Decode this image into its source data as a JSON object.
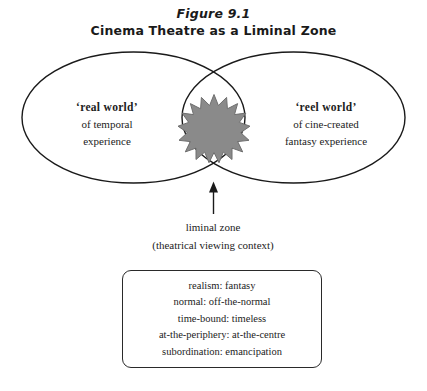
{
  "figure": {
    "title_line1": "Figure 9.1",
    "title_line2": "Cinema Theatre as a Liminal Zone"
  },
  "venn": {
    "left_circle": {
      "heading": "‘real world’",
      "line2": "of temporal",
      "line3": "experience"
    },
    "right_circle": {
      "heading": "‘reel world’",
      "line2": "of cine-created",
      "line3": "fantasy experience"
    },
    "overlap": {
      "shape_name": "starburst",
      "fill_color": "#8a8a8a",
      "stroke_color": "#6f6f6f",
      "points": 16
    },
    "stroke_color": "#1a1a1a"
  },
  "annotation": {
    "caption_line1": "liminal zone",
    "caption_line2": "(theatrical viewing context)"
  },
  "pairs_box": {
    "lines": [
      "realism: fantasy",
      "normal: off-the-normal",
      "time-bound: timeless",
      "at-the-periphery: at-the-centre",
      "subordination: emancipation"
    ],
    "border_color": "#2a2a2a"
  },
  "colors": {
    "background": "#ffffff",
    "ink": "#1c1c1c"
  }
}
